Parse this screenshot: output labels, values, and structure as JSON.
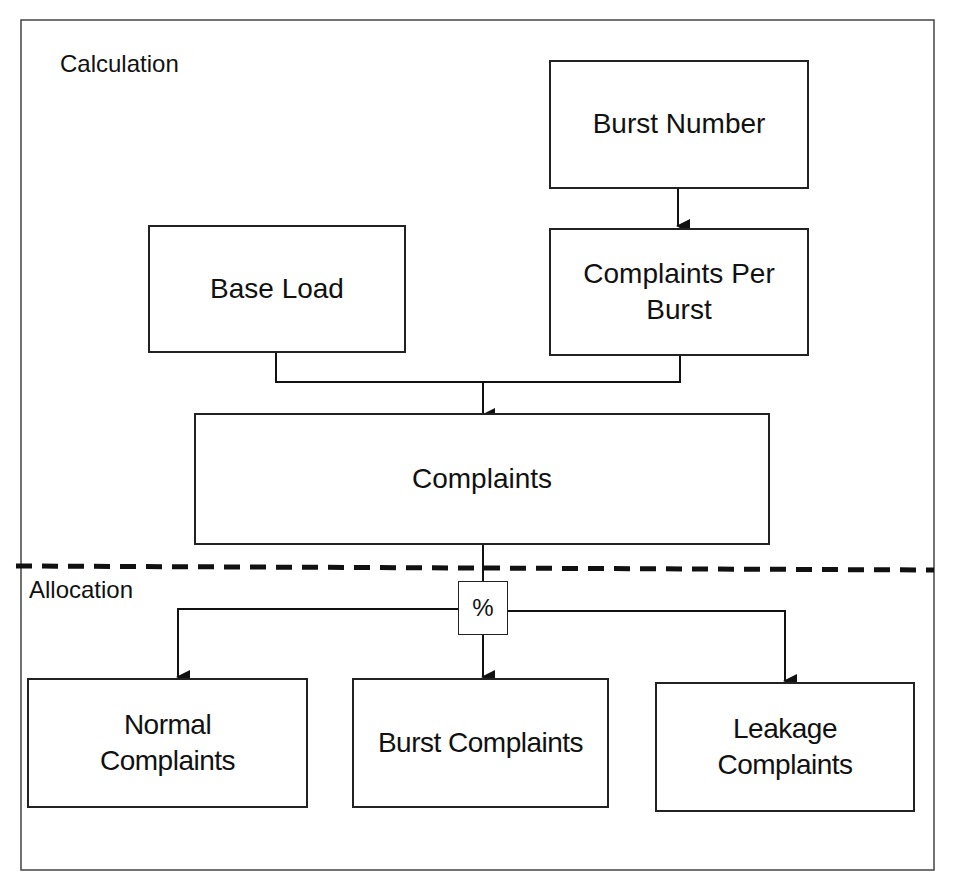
{
  "diagram": {
    "sections": {
      "calculation": "Calculation",
      "allocation": "Allocation"
    },
    "nodes": {
      "burst_number": "Burst Number",
      "base_load": "Base Load",
      "complaints_per_burst": "Complaints Per\nBurst",
      "complaints": "Complaints",
      "percent": "%",
      "normal_complaints": "Normal\nComplaints",
      "burst_complaints": "Burst Complaints",
      "leakage_complaints": "Leakage\nComplaints"
    },
    "edges": [
      {
        "from": "burst_number",
        "to": "complaints_per_burst"
      },
      {
        "from": "base_load",
        "to": "complaints"
      },
      {
        "from": "complaints_per_burst",
        "to": "complaints"
      },
      {
        "from": "complaints",
        "to": "percent"
      },
      {
        "from": "percent",
        "to": "normal_complaints"
      },
      {
        "from": "percent",
        "to": "burst_complaints"
      },
      {
        "from": "percent",
        "to": "leakage_complaints"
      }
    ],
    "colors": {
      "line": "#222222",
      "background": "#ffffff"
    }
  }
}
